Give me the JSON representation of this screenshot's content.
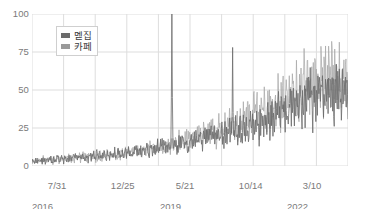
{
  "chart_data": {
    "type": "line",
    "title": "",
    "subtitle": "",
    "xlabel": "",
    "ylabel": "",
    "ylim": [
      0,
      100
    ],
    "yticks": [
      0,
      25,
      50,
      75,
      100
    ],
    "ytick_labels": [
      "0",
      "25",
      "50",
      "75",
      "100"
    ],
    "grid": true,
    "legend_position": "top-left",
    "xtick_labels": [
      {
        "line1": "7/31",
        "line2": "2016"
      },
      {
        "line1": "12/25",
        "line2": ""
      },
      {
        "line1": "5/21",
        "line2": "2019"
      },
      {
        "line1": "10/14",
        "line2": ""
      },
      {
        "line1": "3/10",
        "line2": "2022"
      }
    ],
    "x_axis_note": "weekly search-interest index, 7/31/2016 through early 2023",
    "series": [
      {
        "name": "멛집",
        "color": "#6b6b6b",
        "baseline": [
          3,
          3,
          4,
          4,
          5,
          5,
          5,
          6,
          6,
          6,
          7,
          7,
          7,
          8,
          8,
          9,
          9,
          10,
          10,
          11,
          12,
          12,
          13,
          14,
          15,
          16,
          17,
          18,
          19,
          20,
          21,
          23,
          24,
          25,
          26,
          28,
          30,
          32,
          34,
          36,
          38,
          40,
          42,
          44,
          46,
          47,
          48,
          49,
          50,
          50
        ]
      },
      {
        "name": "카페",
        "color": "#a8a8a8",
        "baseline": [
          3,
          3,
          4,
          4,
          4,
          5,
          5,
          5,
          6,
          6,
          6,
          7,
          7,
          8,
          8,
          9,
          10,
          10,
          11,
          12,
          13,
          14,
          15,
          16,
          17,
          18,
          20,
          21,
          23,
          24,
          26,
          28,
          30,
          32,
          34,
          36,
          38,
          40,
          43,
          45,
          47,
          49,
          51,
          53,
          55,
          56,
          57,
          58,
          58,
          58
        ]
      }
    ],
    "annotations": [
      {
        "label": "spike-to-100",
        "x_frac": 0.443,
        "value": 100
      },
      {
        "label": "spike-to-78",
        "x_frac": 0.635,
        "value": 78
      }
    ]
  },
  "legend": {
    "items": [
      {
        "label": "멛집",
        "color": "#6b6b6b"
      },
      {
        "label": "카페",
        "color": "#9a9a9a"
      }
    ]
  },
  "axis": {
    "y_labels": [
      "100",
      "75",
      "50",
      "25",
      "0"
    ],
    "x_labels": [
      {
        "line1": "7/31",
        "line2": "2016"
      },
      {
        "line1": "12/25",
        "line2": ""
      },
      {
        "line1": "5/21",
        "line2": "2019"
      },
      {
        "line1": "10/14",
        "line2": ""
      },
      {
        "line1": "3/10",
        "line2": "2022"
      }
    ]
  },
  "colors": {
    "grid": "#dddddd",
    "axis_text": "#7a7a7a",
    "series_dark": "#6b6b6b",
    "series_light": "#a8a8a8",
    "background": "#ffffff"
  }
}
